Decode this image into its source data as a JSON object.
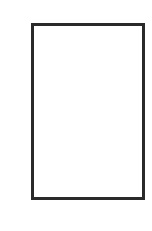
{
  "diagram": {
    "shapes": [
      {
        "type": "rectangle",
        "fill": "#ffffff",
        "stroke": "#2a2a2a",
        "label": ""
      }
    ]
  },
  "colors": {
    "background": "#ffffff",
    "stroke": "#2a2a2a"
  }
}
